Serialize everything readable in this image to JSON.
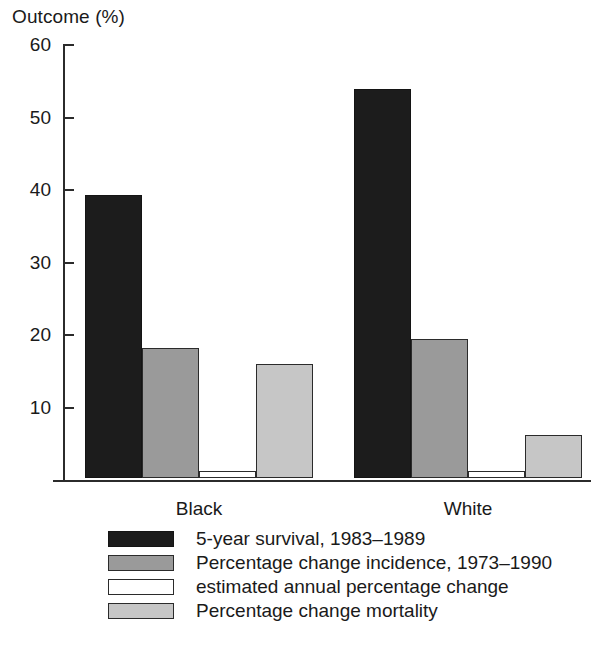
{
  "chart_data": {
    "type": "bar",
    "title": "",
    "ylabel": "Outcome (%)",
    "xlabel": "",
    "ylim": [
      0,
      60
    ],
    "yticks": [
      10,
      20,
      30,
      40,
      50,
      60
    ],
    "ytick_labels": [
      "10",
      "20",
      "30",
      "40",
      "50",
      "60"
    ],
    "grid": false,
    "legend_position": "bottom",
    "categories": [
      "Black",
      "White"
    ],
    "series": [
      {
        "name": "5-year survival, 1983–1989",
        "key": "survival",
        "color": "#1c1c1c",
        "values": [
          39,
          53.7
        ]
      },
      {
        "name": "Percentage change incidence, 1973–1990",
        "key": "incidence",
        "color": "#9a9a9a",
        "values": [
          17.9,
          19.2
        ]
      },
      {
        "name": "estimated annual percentage change",
        "key": "estimated",
        "color": "#ffffff",
        "values": [
          1.0,
          1.0
        ]
      },
      {
        "name": "Percentage change mortality",
        "key": "mortality",
        "color": "#c6c6c6",
        "values": [
          15.7,
          5.9
        ]
      }
    ]
  },
  "axis": {
    "y_title": "Outcome (%)",
    "tick_labels": [
      "60",
      "50",
      "40",
      "30",
      "20",
      "10"
    ],
    "category_labels": [
      "Black",
      "White"
    ]
  },
  "legend": {
    "items": [
      {
        "label": "5-year survival, 1983–1989",
        "swatch": "survival"
      },
      {
        "label": "Percentage change incidence, 1973–1990",
        "swatch": "incidence"
      },
      {
        "label": "estimated annual percentage change",
        "swatch": "estimated"
      },
      {
        "label": "Percentage change mortality",
        "swatch": "mortality"
      }
    ]
  }
}
